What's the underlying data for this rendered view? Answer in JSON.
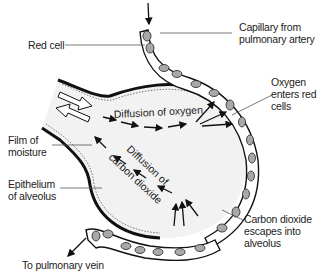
{
  "diagram": {
    "labels": {
      "red_cell": "Red cell",
      "capillary_line1": "Capillary from",
      "capillary_line2": "pulmonary artery",
      "oxygen_line1": "Oxygen",
      "oxygen_line2": "enters red",
      "oxygen_line3": "cells",
      "film_line1": "Film of",
      "film_line2": "moisture",
      "epithelium_line1": "Epithelium",
      "epithelium_line2": "of alveolus",
      "co2_line1": "Carbon dioxide",
      "co2_line2": "escapes into",
      "co2_line3": "alveolus",
      "vein": "To pulmonary vein"
    },
    "inner_labels": {
      "diffusion_oxygen": "Diffusion of oxygen",
      "diffusion_co2_line1": "Diffusion of",
      "diffusion_co2_line2": "carbon dioxide"
    },
    "colors": {
      "outline": "#111111",
      "alveolus_fill": "#f2f2f2",
      "cell_fill": "#a8a8a8",
      "leader_line": "#555555"
    }
  }
}
